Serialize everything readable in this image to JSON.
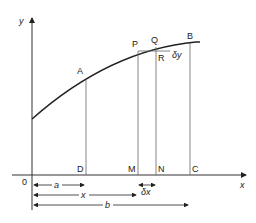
{
  "diagram": {
    "axes": {
      "y_label": "y",
      "x_label": "x",
      "origin_label": "0"
    },
    "points": {
      "A": "A",
      "P": "P",
      "Q": "Q",
      "B": "B",
      "R": "R",
      "D": "D",
      "M": "M",
      "N": "N",
      "C": "C"
    },
    "increments": {
      "delta_y": "δy",
      "delta_x": "δx"
    },
    "dimensions": {
      "a": "a",
      "x": "x",
      "b": "b"
    },
    "colors": {
      "stroke": "#222222",
      "thin": "#555555"
    }
  }
}
